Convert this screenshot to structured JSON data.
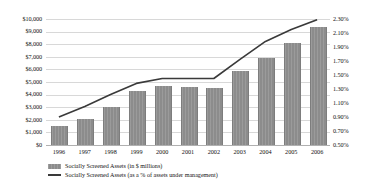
{
  "chart_data": {
    "type": "bar",
    "title": "",
    "xlabel": "",
    "ylabel": "",
    "categories": [
      "1996",
      "1997",
      "1998",
      "1999",
      "2000",
      "2001",
      "2002",
      "2003",
      "2004",
      "2005",
      "2006"
    ],
    "series": [
      {
        "name": "Socially Screened Assets (in $ millions)",
        "type": "bar",
        "axis": "left",
        "values": [
          1500,
          2100,
          3000,
          4300,
          4700,
          4600,
          4500,
          5900,
          6900,
          8100,
          9400
        ]
      },
      {
        "name": "Socially Screened Assets (as a % of assets under management)",
        "type": "line",
        "axis": "right",
        "values": [
          0.9,
          1.05,
          1.22,
          1.38,
          1.45,
          1.45,
          1.45,
          1.72,
          1.98,
          2.15,
          2.29
        ]
      }
    ],
    "left_axis": {
      "ticks": [
        "$0",
        "$1,000",
        "$2,000",
        "$3,000",
        "$4,000",
        "$5,000",
        "$6,000",
        "$7,000",
        "$8,000",
        "$9,000",
        "$10,000"
      ],
      "values": [
        0,
        1000,
        2000,
        3000,
        4000,
        5000,
        6000,
        7000,
        8000,
        9000,
        10000
      ],
      "ylim": [
        0,
        10000
      ]
    },
    "right_axis": {
      "ticks": [
        "0.50%",
        "0.70%",
        "0.90%",
        "1.10%",
        "1.30%",
        "1.50%",
        "1.70%",
        "1.90%",
        "2.10%",
        "2.30%"
      ],
      "values": [
        0.5,
        0.7,
        0.9,
        1.1,
        1.3,
        1.5,
        1.7,
        1.9,
        2.1,
        2.3
      ],
      "ylim": [
        0.5,
        2.3
      ]
    },
    "grid": true,
    "legend_position": "bottom-left",
    "colors": {
      "bar": "#8c8c8c",
      "line": "#3a3a3a",
      "grid": "#d8d8d8",
      "text": "#111111",
      "background": "#ffffff"
    }
  },
  "legend": {
    "items": [
      {
        "label": "Socially Screened Assets (in $ millions)",
        "marker": "bar-swatch"
      },
      {
        "label": "Socially Screened Assets (as a % of assets under management)",
        "marker": "line-swatch"
      }
    ]
  }
}
